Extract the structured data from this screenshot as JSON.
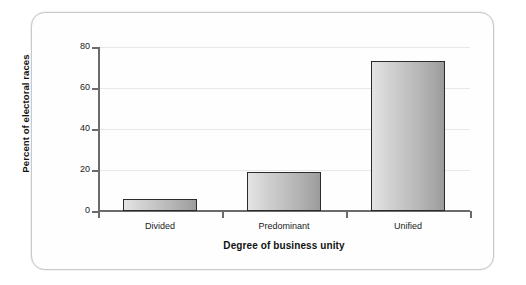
{
  "figure": {
    "card_border_color": "#c9c9c9",
    "background": "#ffffff"
  },
  "chart_data": {
    "type": "bar",
    "title": "",
    "subtitle": "",
    "categories": [
      "Divided",
      "Predominant",
      "Unified"
    ],
    "values": [
      6,
      19,
      73
    ],
    "series": [
      {
        "name": "Percent of electoral races",
        "values": [
          6,
          19,
          73
        ]
      }
    ],
    "xlabel": "Degree of business unity",
    "ylabel": "Percent of electoral races",
    "ylim": [
      0,
      80
    ],
    "yticks": [
      0,
      20,
      40,
      60,
      80
    ],
    "ytick_labels": [
      "0",
      "20",
      "40",
      "60",
      "80"
    ],
    "grid": true,
    "grid_axis": "y",
    "legend": false,
    "legend_position": "none",
    "bar_fill_light": "#e4e4e4",
    "bar_fill_dark": "#9b9b9b",
    "bar_edge_color": "#2b2b2b",
    "axis_color": "#6b6b6b",
    "gridline_color": "#e8e8e8",
    "text_color": "#1a1a1a"
  }
}
